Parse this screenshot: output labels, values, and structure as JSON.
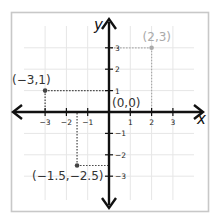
{
  "diagram": {
    "type": "coordinate-plane",
    "axes": {
      "x_label": "x",
      "y_label": "y",
      "x_ticks": [
        {
          "value": -3,
          "label": "−3"
        },
        {
          "value": -2,
          "label": "−2"
        },
        {
          "value": -1,
          "label": "−1"
        },
        {
          "value": 1,
          "label": "1"
        },
        {
          "value": 2,
          "label": "2"
        },
        {
          "value": 3,
          "label": "3"
        }
      ],
      "y_ticks": [
        {
          "value": 3,
          "label": "3"
        },
        {
          "value": 2,
          "label": "2"
        },
        {
          "value": 1,
          "label": "1"
        },
        {
          "value": -1,
          "label": "−1"
        },
        {
          "value": -2,
          "label": "−2"
        },
        {
          "value": -3,
          "label": "−3"
        }
      ],
      "range": {
        "x": [
          -4,
          4
        ],
        "y": [
          -4,
          4
        ]
      }
    },
    "origin_label": "(0,0)",
    "points": [
      {
        "x": -3,
        "y": 1,
        "label": "(−3,1)",
        "color": "#444444",
        "label_color": "#333333"
      },
      {
        "x": 2,
        "y": 3,
        "label": "(2,3)",
        "color": "#aaaaaa",
        "label_color": "#aaaaaa"
      },
      {
        "x": -1.5,
        "y": -2.5,
        "label": "(−1.5,−2.5)",
        "color": "#444444",
        "label_color": "#333333"
      }
    ],
    "colors": {
      "axis": "#111111",
      "grid": "#e6e6e6",
      "frame": "#c8c8c8",
      "tick_label": "#222222"
    }
  }
}
